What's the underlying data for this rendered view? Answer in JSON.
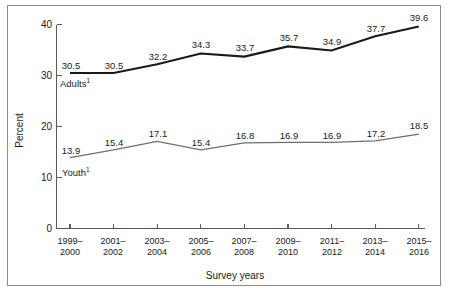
{
  "chart_data": {
    "type": "line",
    "title": "",
    "xlabel": "Survey years",
    "ylabel": "Percent",
    "ylim": [
      0,
      40
    ],
    "yticks": [
      0,
      10,
      20,
      30,
      40
    ],
    "ytick_labels": [
      "0",
      "10",
      "20",
      "30",
      "40"
    ],
    "grid": false,
    "legend_position": "inline-labels",
    "categories": [
      "1999–\n2000",
      "2001–\n2002",
      "2003–\n2004",
      "2005–\n2006",
      "2007–\n2008",
      "2009–\n2010",
      "2011–\n2012",
      "2013–\n2014",
      "2015–\n2016"
    ],
    "categories_lines": [
      [
        "1999–",
        "2000"
      ],
      [
        "2001–",
        "2002"
      ],
      [
        "2003–",
        "2004"
      ],
      [
        "2005–",
        "2006"
      ],
      [
        "2007–",
        "2008"
      ],
      [
        "2009–",
        "2010"
      ],
      [
        "2011–",
        "2012"
      ],
      [
        "2013–",
        "2014"
      ],
      [
        "2015–",
        "2016"
      ]
    ],
    "series": [
      {
        "name": "Adults",
        "footnote_marker": "1",
        "color": "#1a1a1a",
        "line_width": 2.1,
        "values": [
          30.5,
          30.5,
          32.2,
          34.3,
          33.7,
          35.7,
          34.9,
          37.7,
          39.6
        ],
        "labels": [
          "30.5",
          "30.5",
          "32.2",
          "34.3",
          "33.7",
          "35.7",
          "34.9",
          "37.7",
          "39.6"
        ]
      },
      {
        "name": "Youth",
        "footnote_marker": "1",
        "color": "#6e6e6e",
        "line_width": 1.2,
        "values": [
          13.9,
          15.4,
          17.1,
          15.4,
          16.8,
          16.9,
          16.9,
          17.2,
          18.5
        ],
        "labels": [
          "13.9",
          "15.4",
          "17.1",
          "15.4",
          "16.8",
          "16.9",
          "16.9",
          "17.2",
          "18.5"
        ]
      }
    ],
    "axis_color": "#5a5a5a",
    "frame_color": "#8d8d8d",
    "background": "#ffffff"
  }
}
